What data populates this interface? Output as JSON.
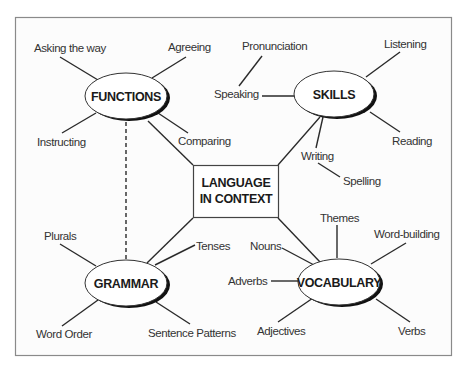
{
  "center": {
    "line1": "LANGUAGE",
    "line2": "IN CONTEXT"
  },
  "hubs": {
    "functions": {
      "label": "FUNCTIONS",
      "branches": [
        "Asking the way",
        "Agreeing",
        "Instructing",
        "Comparing"
      ]
    },
    "skills": {
      "label": "SKILLS",
      "branches": [
        "Pronunciation",
        "Speaking",
        "Listening",
        "Reading",
        "Writing",
        "Spelling"
      ]
    },
    "grammar": {
      "label": "GRAMMAR",
      "branches": [
        "Plurals",
        "Tenses",
        "Word Order",
        "Sentence Patterns"
      ]
    },
    "vocabulary": {
      "label": "VOCABULARY",
      "branches": [
        "Themes",
        "Word-building",
        "Nouns",
        "Adverbs",
        "Adjectives",
        "Verbs"
      ]
    }
  },
  "colors": {
    "line": "#2a2a2a",
    "frame": "#8a8a8a",
    "background": "#fcfcfc"
  }
}
